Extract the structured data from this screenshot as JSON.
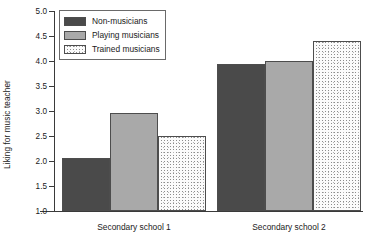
{
  "chart_data": {
    "type": "bar",
    "title": "",
    "xlabel": "",
    "ylabel": "Liking for music teacher",
    "ylim": [
      1.0,
      5.0
    ],
    "ytick_labels": [
      "1.0",
      "1.5",
      "2.0",
      "2.5",
      "3.0",
      "3.5",
      "4.0",
      "4.5",
      "5.0"
    ],
    "ytick_values": [
      1.0,
      1.5,
      2.0,
      2.5,
      3.0,
      3.5,
      4.0,
      4.5,
      5.0
    ],
    "grid": false,
    "legend_position": "upper left",
    "categories": [
      "Secondary school 1",
      "Secondary school 2"
    ],
    "series": [
      {
        "name": "Non-musicians",
        "values": [
          2.07,
          3.95
        ],
        "color": "#4a4a4a",
        "fill": "solid-dark"
      },
      {
        "name": "Playing musicians",
        "values": [
          2.96,
          4.01
        ],
        "color": "#a9a9a9",
        "fill": "solid-mid"
      },
      {
        "name": "Trained musicians",
        "values": [
          2.51,
          4.4
        ],
        "color": "#fbfbfb",
        "fill": "speckle"
      }
    ]
  }
}
